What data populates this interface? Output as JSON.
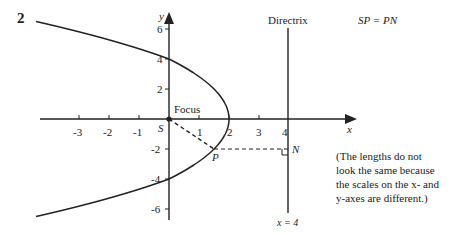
{
  "question_number": "2",
  "labels": {
    "directrix": "Directrix",
    "equation": "SP = PN",
    "focus": "Focus",
    "s_point": "S",
    "p_point": "P",
    "n_point": "N",
    "directrix_eq": "x = 4",
    "x_axis": "x",
    "y_axis": "y"
  },
  "note": [
    "(The lengths do not",
    "look the same because",
    "the scales on the x- and",
    "y-axes are different.)"
  ],
  "x_ticks": [
    "-3",
    "-2",
    "-1",
    "1",
    "2",
    "3",
    "4"
  ],
  "y_ticks": [
    "6",
    "4",
    "2",
    "-2",
    "-4",
    "-6"
  ],
  "chart_data": {
    "type": "line",
    "curve": "y^2 = -8(x - 2)",
    "focus": [
      0,
      0
    ],
    "vertex": [
      2,
      0
    ],
    "directrix": "x = 4",
    "point_P": [
      1.5,
      -2
    ],
    "point_N": [
      4,
      -2
    ],
    "xlabel": "x",
    "ylabel": "y",
    "xlim": [
      -4.3,
      5.3
    ],
    "ylim": [
      -7,
      7
    ]
  }
}
